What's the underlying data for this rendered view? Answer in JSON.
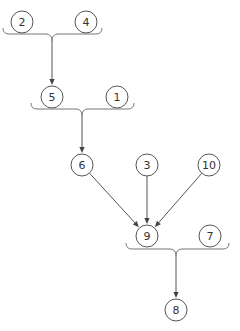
{
  "diagram": {
    "title": "",
    "colors": {
      "node_stroke": "#555555",
      "edge": "#555555",
      "brace": "#777777",
      "label": "#333333"
    },
    "nodes": [
      {
        "id": "n2",
        "label": "2",
        "x": 22,
        "y": 22
      },
      {
        "id": "n4",
        "label": "4",
        "x": 86,
        "y": 22
      },
      {
        "id": "n5",
        "label": "5",
        "x": 52,
        "y": 97
      },
      {
        "id": "n1",
        "label": "1",
        "x": 117,
        "y": 97
      },
      {
        "id": "n6",
        "label": "6",
        "x": 82,
        "y": 165
      },
      {
        "id": "n3",
        "label": "3",
        "x": 147,
        "y": 165
      },
      {
        "id": "n10",
        "label": "10",
        "x": 209,
        "y": 165
      },
      {
        "id": "n9",
        "label": "9",
        "x": 147,
        "y": 236
      },
      {
        "id": "n7",
        "label": "7",
        "x": 210,
        "y": 236
      },
      {
        "id": "n8",
        "label": "8",
        "x": 176,
        "y": 310
      }
    ],
    "node_radius": 11,
    "groups": [
      {
        "id": "g1",
        "members": [
          "2",
          "4"
        ],
        "x1": 3,
        "x2": 102,
        "y": 34,
        "tip_x": 52,
        "tip_y": 41,
        "target": "5"
      },
      {
        "id": "g2",
        "members": [
          "5",
          "1"
        ],
        "x1": 31,
        "x2": 134,
        "y": 109,
        "tip_x": 82,
        "tip_y": 116,
        "target": "6"
      },
      {
        "id": "g3",
        "members": [
          "9",
          "7"
        ],
        "x1": 126,
        "x2": 229,
        "y": 249,
        "tip_x": 176,
        "tip_y": 256,
        "target": "8"
      }
    ],
    "edges": [
      {
        "from": "6",
        "to": "9"
      },
      {
        "from": "3",
        "to": "9"
      },
      {
        "from": "10",
        "to": "9"
      }
    ]
  }
}
